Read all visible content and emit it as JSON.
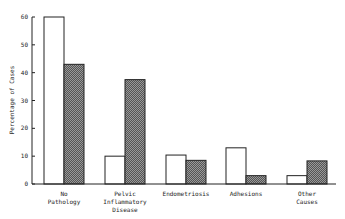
{
  "chart_data": {
    "type": "bar",
    "title": "",
    "xlabel": "",
    "ylabel": "Percentage of Cases",
    "ylim": [
      0,
      60
    ],
    "yticks": [
      0,
      10,
      20,
      30,
      40,
      50,
      60
    ],
    "categories": [
      "No Pathology",
      "Pelvic Inflammatory Disease",
      "Endometriosis",
      "Adhesions",
      "Other Causes"
    ],
    "category_lines": [
      [
        "No",
        "Pathology"
      ],
      [
        "Pelvic",
        "Inflammatory",
        "Disease"
      ],
      [
        "Endometriosis"
      ],
      [
        "Adhesions"
      ],
      [
        "Other",
        "Causes"
      ]
    ],
    "series": [
      {
        "name": "Series 1 (open bars)",
        "fill": "#ffffff",
        "values": [
          60,
          10,
          10.4,
          13,
          3
        ]
      },
      {
        "name": "Series 2 (hatched bars)",
        "fill": "hatched",
        "values": [
          43,
          37.5,
          8.5,
          3,
          8.3
        ]
      }
    ],
    "grid": false,
    "legend": null
  }
}
